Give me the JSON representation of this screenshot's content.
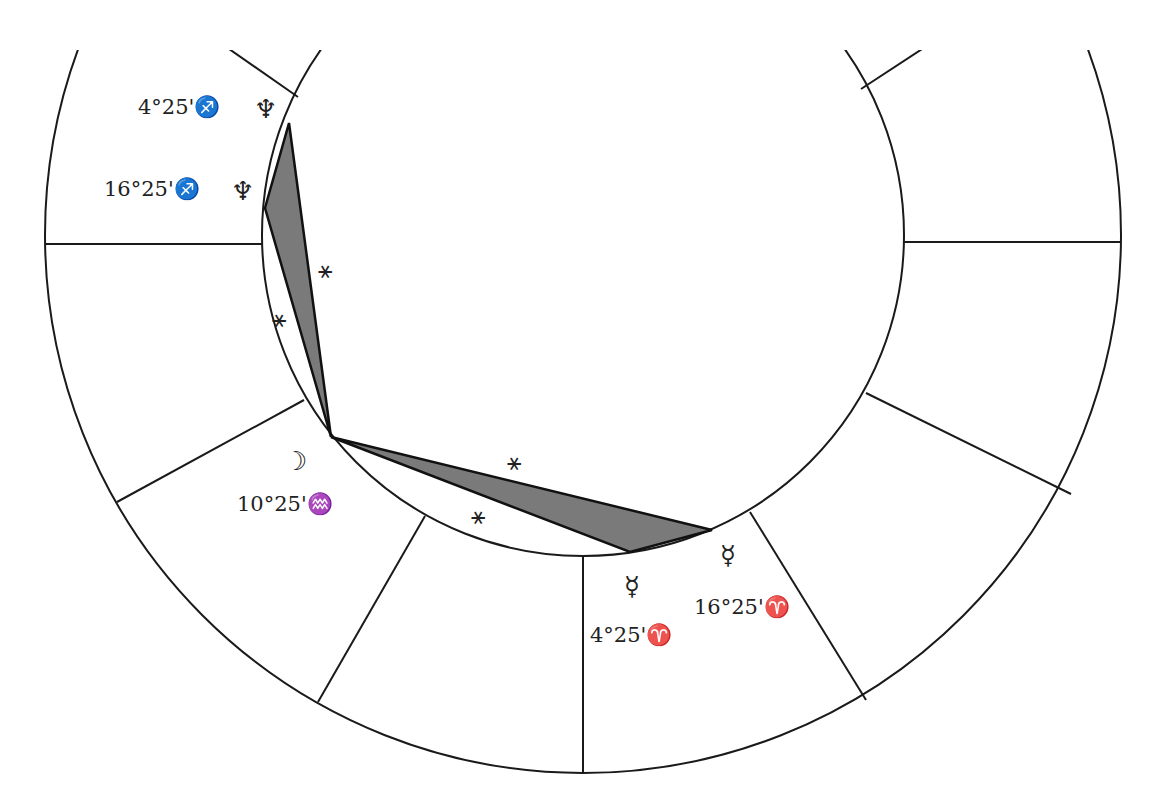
{
  "diagram": {
    "type": "astrological-wheel-partial",
    "line_color": "#1a1a1a",
    "triangle_fill": "#7a7a7a",
    "planets": [
      {
        "name": "Neptune",
        "glyph": "♆",
        "position": "4°25'♐",
        "label": "4°25'♐"
      },
      {
        "name": "Neptune",
        "glyph": "♆",
        "position": "16°25'♐",
        "label": "16°25'♐"
      },
      {
        "name": "Moon",
        "glyph": "☽",
        "position": "10°25'♒",
        "label": "10°25'♒"
      },
      {
        "name": "Mercury",
        "glyph": "☿",
        "position": "4°25'♈",
        "label": "4°25'♈"
      },
      {
        "name": "Mercury",
        "glyph": "☿",
        "position": "16°25'♈",
        "label": "16°25'♈"
      }
    ],
    "aspects": [
      {
        "symbol": "⚹",
        "name": "sextile"
      },
      {
        "symbol": "⚹",
        "name": "sextile"
      },
      {
        "symbol": "⚹",
        "name": "sextile"
      },
      {
        "symbol": "⚹",
        "name": "sextile"
      }
    ]
  }
}
